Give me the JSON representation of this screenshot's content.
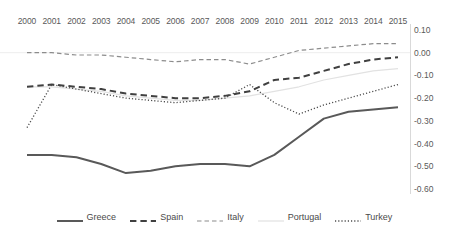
{
  "chart_data": {
    "type": "line",
    "title": "",
    "subtitle": "",
    "xlabel": "",
    "ylabel": "",
    "x": [
      2000,
      2001,
      2002,
      2003,
      2004,
      2005,
      2006,
      2007,
      2008,
      2009,
      2010,
      2011,
      2012,
      2013,
      2014,
      2015
    ],
    "xtick_labels": [
      "2000",
      "2001",
      "2002",
      "2003",
      "2004",
      "2005",
      "2006",
      "2007",
      "2008",
      "2009",
      "2010",
      "2011",
      "2012",
      "2013",
      "2014",
      "2015"
    ],
    "xaxis_position": "top",
    "yaxis_position": "right",
    "ylim": [
      -0.6,
      0.1
    ],
    "ytick_labels": [
      "0.10",
      "0.00",
      "-0.10",
      "-0.20",
      "-0.30",
      "-0.40",
      "-0.50",
      "-0.60"
    ],
    "ytick_values": [
      0.1,
      0.0,
      -0.1,
      -0.2,
      -0.3,
      -0.4,
      -0.5,
      -0.6
    ],
    "grid": false,
    "legend_position": "bottom",
    "series": [
      {
        "name": "Greece",
        "style": "solid",
        "color": "#595959",
        "width": 2.0,
        "values": [
          -0.45,
          -0.45,
          -0.46,
          -0.49,
          -0.53,
          -0.52,
          -0.5,
          -0.49,
          -0.49,
          -0.5,
          -0.45,
          -0.37,
          -0.29,
          -0.26,
          -0.25,
          -0.24
        ]
      },
      {
        "name": "Spain",
        "style": "dashed",
        "color": "#404040",
        "width": 2.0,
        "values": [
          -0.15,
          -0.14,
          -0.15,
          -0.16,
          -0.18,
          -0.19,
          -0.2,
          -0.2,
          -0.19,
          -0.17,
          -0.12,
          -0.11,
          -0.08,
          -0.05,
          -0.03,
          -0.02
        ]
      },
      {
        "name": "Italy",
        "style": "dashed-thin",
        "color": "#8c8c8c",
        "width": 1.2,
        "values": [
          0.0,
          0.0,
          -0.01,
          -0.01,
          -0.02,
          -0.03,
          -0.04,
          -0.03,
          -0.03,
          -0.05,
          -0.02,
          0.01,
          0.02,
          0.03,
          0.04,
          0.04
        ]
      },
      {
        "name": "Portugal",
        "style": "solid-faint",
        "color": "#e2e2e2",
        "width": 1.2,
        "values": [
          -0.15,
          -0.15,
          -0.16,
          -0.17,
          -0.19,
          -0.2,
          -0.21,
          -0.21,
          -0.2,
          -0.19,
          -0.17,
          -0.15,
          -0.12,
          -0.1,
          -0.08,
          -0.07
        ]
      },
      {
        "name": "Turkey",
        "style": "dotted",
        "color": "#4d4d4d",
        "width": 1.3,
        "values": [
          -0.33,
          -0.14,
          -0.16,
          -0.18,
          -0.2,
          -0.21,
          -0.22,
          -0.21,
          -0.2,
          -0.14,
          -0.22,
          -0.27,
          -0.23,
          -0.2,
          -0.17,
          -0.14
        ]
      }
    ]
  },
  "legend": {
    "items": [
      {
        "label": "Greece"
      },
      {
        "label": "Spain"
      },
      {
        "label": "Italy"
      },
      {
        "label": "Portugal"
      },
      {
        "label": "Turkey"
      }
    ]
  }
}
